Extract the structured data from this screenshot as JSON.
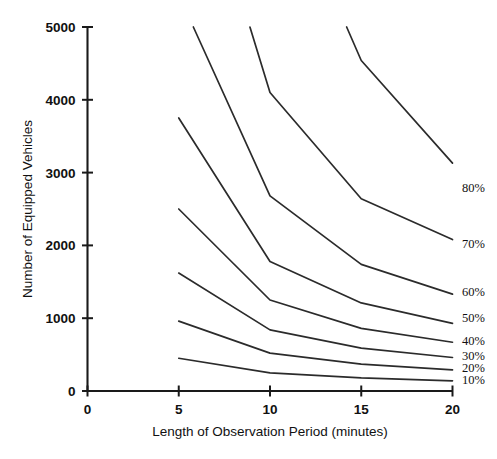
{
  "chart_data": {
    "type": "line",
    "title": "",
    "xlabel": "Length of Observation Period (minutes)",
    "ylabel": "Number of Equipped Vehicles",
    "xlim": [
      0,
      20
    ],
    "ylim": [
      0,
      5000
    ],
    "xticks": [
      "0",
      "5",
      "10",
      "15",
      "20"
    ],
    "xtick_values": [
      0,
      5,
      10,
      15,
      20
    ],
    "yticks": [
      "0",
      "1000",
      "2000",
      "3000",
      "4000",
      "5000"
    ],
    "ytick_values": [
      0,
      1000,
      2000,
      3000,
      4000,
      5000
    ],
    "grid": false,
    "legend_position": "right-inline-labels",
    "series": [
      {
        "name": "80%",
        "label": "80%",
        "x": [
          14.2,
          15.0,
          20.0
        ],
        "values": [
          5000,
          4540,
          3130
        ]
      },
      {
        "name": "70%",
        "label": "70%",
        "x": [
          8.9,
          10.0,
          15.0,
          20.0
        ],
        "values": [
          5000,
          4100,
          2640,
          2080
        ]
      },
      {
        "name": "60%",
        "label": "60%",
        "x": [
          5.8,
          10.0,
          15.0,
          20.0
        ],
        "values": [
          5000,
          2680,
          1740,
          1330
        ]
      },
      {
        "name": "50%",
        "label": "50%",
        "x": [
          5.0,
          10.0,
          15.0,
          20.0
        ],
        "values": [
          3750,
          1780,
          1210,
          930
        ]
      },
      {
        "name": "40%",
        "label": "40%",
        "x": [
          5.0,
          10.0,
          15.0,
          20.0
        ],
        "values": [
          2500,
          1250,
          860,
          670
        ]
      },
      {
        "name": "30%",
        "label": "30%",
        "x": [
          5.0,
          10.0,
          15.0,
          20.0
        ],
        "values": [
          1620,
          840,
          590,
          460
        ]
      },
      {
        "name": "20%",
        "label": "20%",
        "x": [
          5.0,
          10.0,
          15.0,
          20.0
        ],
        "values": [
          960,
          520,
          370,
          290
        ]
      },
      {
        "name": "10%",
        "label": "10%",
        "x": [
          5.0,
          10.0,
          15.0,
          20.0
        ],
        "values": [
          450,
          250,
          180,
          140
        ]
      }
    ],
    "series_label_positions": [
      {
        "label": "80%",
        "x": 462,
        "y": 192
      },
      {
        "label": "70%",
        "x": 462,
        "y": 248
      },
      {
        "label": "60%",
        "x": 462,
        "y": 296
      },
      {
        "label": "50%",
        "x": 462,
        "y": 322
      },
      {
        "label": "40%",
        "x": 462,
        "y": 345
      },
      {
        "label": "30%",
        "x": 462,
        "y": 360
      },
      {
        "label": "20%",
        "x": 462,
        "y": 372
      },
      {
        "label": "10%",
        "x": 462,
        "y": 384
      }
    ]
  },
  "axes": {
    "y_title": "Number of Equipped Vehicles",
    "x_title": "Length of Observation Period (minutes)"
  }
}
